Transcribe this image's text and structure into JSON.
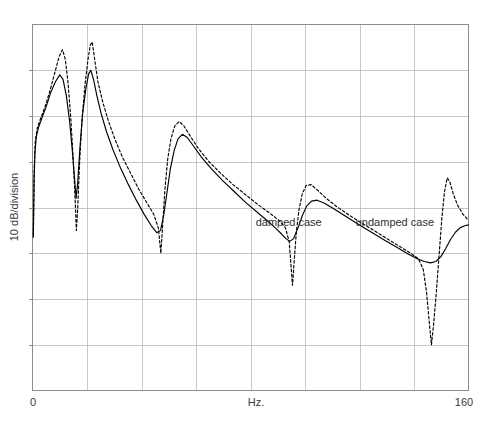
{
  "chart_data": {
    "type": "line",
    "title": "",
    "subtitle": "",
    "xlabel": "Hz.",
    "ylabel": "10 dB/division",
    "xlim": [
      0,
      160
    ],
    "ylim": [
      0,
      80
    ],
    "xticklabels": [
      "0",
      "160"
    ],
    "xtick_positions": [
      0,
      160
    ],
    "yticklabels": [],
    "grid": true,
    "grid_columns": 8,
    "grid_rows": 8,
    "grid_color": "#b9b9b9",
    "frame_color": "#8c8c8c",
    "legend": "none",
    "annotations": [
      {
        "text": "damped case",
        "x": 94,
        "y": 36,
        "name": "damped-case-label"
      },
      {
        "text": "undamped case",
        "x": 133,
        "y": 36,
        "name": "undamped-case-label"
      }
    ],
    "series": [
      {
        "name": "damped case",
        "style": "solid",
        "color": "#000000",
        "points": [
          [
            0.3,
            33.5
          ],
          [
            0.6,
            46.0
          ],
          [
            0.9,
            52.0
          ],
          [
            1.4,
            55.5
          ],
          [
            2.2,
            57.5
          ],
          [
            3.4,
            59.5
          ],
          [
            5.0,
            62.0
          ],
          [
            6.6,
            65.0
          ],
          [
            8.4,
            67.5
          ],
          [
            10.0,
            69.0
          ],
          [
            11.2,
            68.0
          ],
          [
            12.4,
            64.5
          ],
          [
            13.6,
            59.0
          ],
          [
            14.6,
            52.5
          ],
          [
            15.4,
            46.5
          ],
          [
            16.0,
            42.0
          ],
          [
            16.6,
            45.5
          ],
          [
            17.4,
            53.0
          ],
          [
            18.4,
            60.5
          ],
          [
            19.6,
            66.0
          ],
          [
            20.6,
            69.2
          ],
          [
            21.4,
            70.0
          ],
          [
            22.4,
            68.0
          ],
          [
            23.6,
            64.5
          ],
          [
            25.2,
            60.5
          ],
          [
            27.2,
            56.5
          ],
          [
            29.6,
            52.5
          ],
          [
            32.4,
            48.5
          ],
          [
            35.2,
            45.0
          ],
          [
            38.2,
            41.5
          ],
          [
            41.0,
            38.5
          ],
          [
            43.6,
            36.0
          ],
          [
            45.6,
            34.5
          ],
          [
            47.0,
            35.0
          ],
          [
            48.2,
            38.5
          ],
          [
            49.4,
            43.5
          ],
          [
            50.6,
            48.5
          ],
          [
            52.0,
            52.5
          ],
          [
            53.4,
            55.0
          ],
          [
            55.0,
            56.0
          ],
          [
            56.8,
            55.3
          ],
          [
            59.0,
            53.5
          ],
          [
            62.0,
            51.0
          ],
          [
            65.6,
            48.5
          ],
          [
            69.6,
            46.0
          ],
          [
            74.0,
            43.5
          ],
          [
            78.4,
            41.0
          ],
          [
            82.8,
            38.8
          ],
          [
            86.4,
            37.0
          ],
          [
            89.2,
            35.5
          ],
          [
            91.4,
            34.2
          ],
          [
            93.0,
            33.2
          ],
          [
            94.4,
            32.6
          ],
          [
            95.8,
            33.2
          ],
          [
            97.4,
            35.5
          ],
          [
            99.0,
            38.2
          ],
          [
            100.6,
            40.3
          ],
          [
            102.4,
            41.4
          ],
          [
            104.4,
            41.6
          ],
          [
            107.0,
            41.0
          ],
          [
            110.4,
            39.8
          ],
          [
            114.6,
            38.2
          ],
          [
            119.4,
            36.4
          ],
          [
            124.4,
            34.6
          ],
          [
            129.4,
            32.8
          ],
          [
            134.0,
            31.2
          ],
          [
            138.0,
            29.8
          ],
          [
            141.2,
            28.8
          ],
          [
            143.8,
            28.2
          ],
          [
            146.0,
            27.9
          ],
          [
            148.0,
            28.2
          ],
          [
            149.8,
            29.2
          ],
          [
            151.6,
            31.0
          ],
          [
            153.4,
            33.0
          ],
          [
            155.2,
            34.6
          ],
          [
            157.0,
            35.6
          ],
          [
            158.6,
            36.0
          ],
          [
            160.0,
            36.2
          ]
        ]
      },
      {
        "name": "undamped case",
        "style": "dashed",
        "color": "#000000",
        "points": [
          [
            0.3,
            34.0
          ],
          [
            0.6,
            48.0
          ],
          [
            1.0,
            54.5
          ],
          [
            1.8,
            57.5
          ],
          [
            3.0,
            59.5
          ],
          [
            4.6,
            62.0
          ],
          [
            6.4,
            65.5
          ],
          [
            8.2,
            69.5
          ],
          [
            9.8,
            73.0
          ],
          [
            11.0,
            74.5
          ],
          [
            12.0,
            72.5
          ],
          [
            13.0,
            67.5
          ],
          [
            14.0,
            60.0
          ],
          [
            14.9,
            51.0
          ],
          [
            15.6,
            42.5
          ],
          [
            16.1,
            35.0
          ],
          [
            16.6,
            40.0
          ],
          [
            17.3,
            50.0
          ],
          [
            18.2,
            59.5
          ],
          [
            19.3,
            67.0
          ],
          [
            20.4,
            72.5
          ],
          [
            21.2,
            75.5
          ],
          [
            21.9,
            76.2
          ],
          [
            22.8,
            72.5
          ],
          [
            24.0,
            67.5
          ],
          [
            25.8,
            63.0
          ],
          [
            27.8,
            59.0
          ],
          [
            30.2,
            55.0
          ],
          [
            33.0,
            51.0
          ],
          [
            36.0,
            47.5
          ],
          [
            39.0,
            44.0
          ],
          [
            42.0,
            41.0
          ],
          [
            44.5,
            38.5
          ],
          [
            46.2,
            35.5
          ],
          [
            47.1,
            30.0
          ],
          [
            47.8,
            36.5
          ],
          [
            48.6,
            44.0
          ],
          [
            49.6,
            50.5
          ],
          [
            50.8,
            55.0
          ],
          [
            52.2,
            57.8
          ],
          [
            53.8,
            58.8
          ],
          [
            55.6,
            57.8
          ],
          [
            58.0,
            55.5
          ],
          [
            61.0,
            52.8
          ],
          [
            64.8,
            50.0
          ],
          [
            69.0,
            47.5
          ],
          [
            73.6,
            45.0
          ],
          [
            78.2,
            42.8
          ],
          [
            82.8,
            40.6
          ],
          [
            87.0,
            38.8
          ],
          [
            90.4,
            37.2
          ],
          [
            92.8,
            35.6
          ],
          [
            94.2,
            32.5
          ],
          [
            94.9,
            27.0
          ],
          [
            95.4,
            23.0
          ],
          [
            96.0,
            28.0
          ],
          [
            96.8,
            34.5
          ],
          [
            97.8,
            39.5
          ],
          [
            99.0,
            43.0
          ],
          [
            100.4,
            44.8
          ],
          [
            102.2,
            45.0
          ],
          [
            104.6,
            43.8
          ],
          [
            107.8,
            42.0
          ],
          [
            111.6,
            40.2
          ],
          [
            116.0,
            38.4
          ],
          [
            120.8,
            36.6
          ],
          [
            125.8,
            34.8
          ],
          [
            130.6,
            33.0
          ],
          [
            135.0,
            31.4
          ],
          [
            138.8,
            30.0
          ],
          [
            141.6,
            28.8
          ],
          [
            143.4,
            26.5
          ],
          [
            144.6,
            21.5
          ],
          [
            145.6,
            15.0
          ],
          [
            146.4,
            10.0
          ],
          [
            147.2,
            14.5
          ],
          [
            148.2,
            21.5
          ],
          [
            149.2,
            29.5
          ],
          [
            150.2,
            37.5
          ],
          [
            151.2,
            43.5
          ],
          [
            152.2,
            46.5
          ],
          [
            153.2,
            45.5
          ],
          [
            154.4,
            43.0
          ],
          [
            156.0,
            40.5
          ],
          [
            158.0,
            38.5
          ],
          [
            160.0,
            37.2
          ]
        ]
      }
    ]
  }
}
